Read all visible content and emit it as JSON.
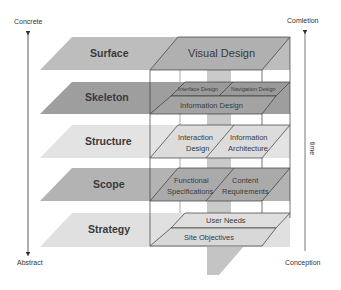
{
  "diagram": {
    "type": "layered-plane-diagram",
    "left_axis": {
      "top_label": "Concrete",
      "bottom_label": "Abstract"
    },
    "right_axis": {
      "top_label": "Comletion",
      "bottom_label": "Conception",
      "side_label": "time"
    },
    "colors": {
      "surface": "#bdbdbd",
      "skeleton": "#9e9e9e",
      "structure": "#e3e3e3",
      "scope": "#b3b3b3",
      "strategy": "#e0e0e0",
      "box_line": "#3a3a3a",
      "center_arrow": "#a8a8a8"
    },
    "layers": [
      {
        "name": "Surface",
        "elements": [
          "Visual Design"
        ]
      },
      {
        "name": "Skeleton",
        "elements": [
          "Interface Design",
          "Navigation Design",
          "Information Design"
        ]
      },
      {
        "name": "Structure",
        "elements": [
          "Interaction Design",
          "Information Architecture"
        ]
      },
      {
        "name": "Scope",
        "elements": [
          "Functional Specifications",
          "Content Requirements"
        ]
      },
      {
        "name": "Strategy",
        "elements": [
          "User Needs",
          "Site Objectives"
        ]
      }
    ],
    "cells": {
      "visual_design": "Visual Design",
      "interface_design": "Interface Design",
      "navigation_design": "Navigation Design",
      "information_design": "Information Design",
      "interaction_design_1": "Interaction",
      "interaction_design_2": "Design",
      "information_architecture_1": "Information",
      "information_architecture_2": "Architecture",
      "functional_specs_1": "Functional",
      "functional_specs_2": "Specifications",
      "content_requirements_1": "Content",
      "content_requirements_2": "Requirements",
      "user_needs": "User Needs",
      "site_objectives": "Site Objectives"
    }
  }
}
